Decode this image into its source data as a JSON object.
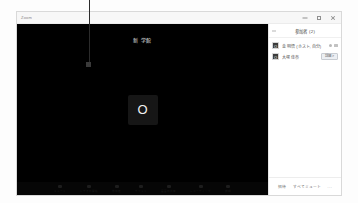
{
  "window": {
    "title": "Zoom",
    "controls": {
      "minimize_label": "minimize",
      "maximize_label": "maximize",
      "close_label": "close"
    }
  },
  "stage": {
    "meeting_title": "新 学館",
    "active_speaker": {
      "initial": "O"
    },
    "toolbar": [
      {
        "icon": "microphone-icon",
        "label": "ミュート"
      },
      {
        "icon": "camera-icon",
        "label": "ビデオの開始"
      },
      {
        "icon": "participants-icon",
        "label": "参加者"
      },
      {
        "icon": "chat-icon",
        "label": "チャット"
      },
      {
        "icon": "share-icon",
        "label": "画面の共有"
      },
      {
        "icon": "record-icon",
        "label": "レコーディング"
      },
      {
        "icon": "more-icon",
        "label": "詳細"
      }
    ]
  },
  "panel": {
    "title": "参加者 (2)",
    "back_icon": "chevron-left-icon",
    "participants": [
      {
        "avatar_initial": "O",
        "name": "金 明悟 (ホスト, 自分)",
        "icons": [
          "mic-muted-icon",
          "video-off-icon"
        ],
        "badge": ""
      },
      {
        "avatar_initial": "O",
        "name": "大塚 佳奈",
        "icons": [],
        "badge": "詳細 >"
      }
    ],
    "footer": {
      "invite_label": "招待",
      "mute_all_label": "すべてミュート",
      "more_label": "..."
    }
  },
  "annotation": {
    "leader_line": "callout-line"
  },
  "colors": {
    "stage_background": "#000000",
    "panel_background": "#ffffff",
    "window_border": "#d9d9d9",
    "title_bar": "#f7f7f7",
    "badge_background": "#eceff3",
    "text_primary": "#4c4c4c",
    "text_secondary": "#6b6b6b"
  }
}
